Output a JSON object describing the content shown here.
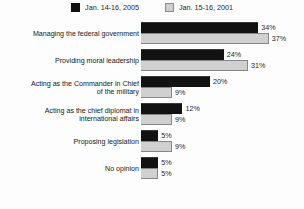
{
  "chart_data": {
    "type": "bar",
    "title": "",
    "subtitle": "",
    "xlabel": "",
    "ylabel": "",
    "orientation": "horizontal",
    "grid": false,
    "legend_position": "top-center",
    "value_suffix": "%",
    "xlim": [
      0,
      40
    ],
    "axis_max": 40,
    "categories": [
      "Managing the federal government",
      "Providing moral leadership",
      "Acting as the Commander in Chief\nof the military",
      "Acting as the chief diplomat in\ninternational affairs",
      "Proposing legislation",
      "No opinion"
    ],
    "series": [
      {
        "name": "Jan. 14-16, 2005",
        "color": "#121212",
        "values": [
          34,
          24,
          20,
          12,
          5,
          5
        ],
        "labels": [
          "34%",
          "24%",
          "20%",
          "12%",
          "5%",
          "5%"
        ]
      },
      {
        "name": "Jan. 15-16, 2001",
        "color": "#d0d0d0",
        "values": [
          37,
          31,
          9,
          9,
          9,
          5
        ],
        "labels": [
          "37%",
          "31%",
          "9%",
          "9%",
          "9%",
          "5%"
        ]
      }
    ]
  },
  "legend": {
    "items": [
      {
        "label": "Jan. 14-16, 2005",
        "swatch": "legend-swatch-black",
        "color": "#121212"
      },
      {
        "label": "Jan. 15-16, 2001",
        "swatch": "legend-swatch-gray",
        "color": "#d0d0d0"
      }
    ]
  },
  "rows": [
    {
      "category": "Managing the federal government",
      "a_label": "34%",
      "a_value": 34,
      "b_label": "37%",
      "b_value": 37
    },
    {
      "category": "Providing moral leadership",
      "a_label": "24%",
      "a_value": 24,
      "b_label": "31%",
      "b_value": 31
    },
    {
      "category": "Acting as the Commander in Chief\nof the military",
      "a_label": "20%",
      "a_value": 20,
      "b_label": "9%",
      "b_value": 9
    },
    {
      "category": "Acting as the chief diplomat in\ninternational affairs",
      "a_label": "12%",
      "a_value": 12,
      "b_label": "9%",
      "b_value": 9
    },
    {
      "category": "Proposing legislation",
      "a_label": "5%",
      "a_value": 5,
      "b_label": "9%",
      "b_value": 9
    },
    {
      "category": "No opinion",
      "a_label": "5%",
      "a_value": 5,
      "b_label": "5%",
      "b_value": 5
    }
  ]
}
